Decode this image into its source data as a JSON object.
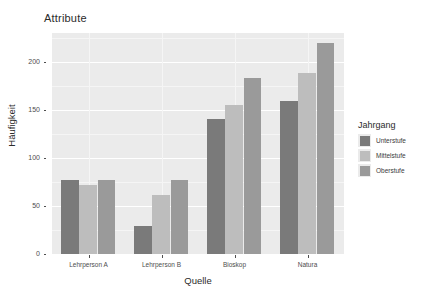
{
  "chart_data": {
    "type": "bar",
    "title": "Attribute",
    "xlabel": "Quelle",
    "ylabel": "Häufigkeit",
    "categories": [
      "Lehrperson A",
      "Lehrperson B",
      "Bioskop",
      "Natura"
    ],
    "series": [
      {
        "name": "Unterstufe",
        "color": "#7a7a7a",
        "values": [
          77,
          29,
          140,
          159
        ]
      },
      {
        "name": "Mittelstufe",
        "color": "#bdbdbd",
        "values": [
          72,
          61,
          155,
          188
        ]
      },
      {
        "name": "Oberstufe",
        "color": "#9a9a9a",
        "values": [
          77,
          77,
          183,
          220
        ]
      }
    ],
    "ylim": [
      0,
      230
    ],
    "yticks": [
      0,
      50,
      100,
      150,
      200
    ],
    "ytick_labels": [
      "0",
      "50",
      "100",
      "150",
      "200"
    ],
    "legend_title": "Jahrgang",
    "legend_position": "right",
    "grid": true,
    "panel_background": "#ebebeb",
    "grid_color": "#ffffff",
    "plot_background": "#ffffff"
  },
  "legend": {
    "title": "Jahrgang",
    "items": [
      {
        "label": "Unterstufe",
        "color": "#7a7a7a"
      },
      {
        "label": "Mittelstufe",
        "color": "#bdbdbd"
      },
      {
        "label": "Oberstufe",
        "color": "#9a9a9a"
      }
    ]
  }
}
